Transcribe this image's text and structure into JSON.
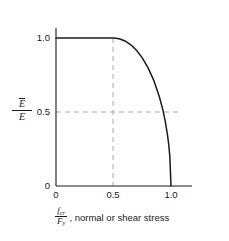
{
  "chart_data": {
    "type": "line",
    "title": "",
    "subtitle": "",
    "xlabel_numerator": "f",
    "xlabel_numerator_sub": "cr",
    "xlabel_denominator": "F",
    "xlabel_denominator_sub": "y",
    "xlabel_caption": ", normal or shear stress",
    "ylabel_numerator": "E",
    "ylabel_numerator_overbar": true,
    "ylabel_denominator": "E",
    "xlim": [
      0,
      1.15
    ],
    "ylim": [
      0,
      1.12
    ],
    "xticks": [
      0,
      0.5,
      1.0
    ],
    "xticklabels": [
      "0",
      "0.5",
      "1.0"
    ],
    "yticks": [
      0,
      0.5,
      1.0
    ],
    "yticklabels": [
      "0",
      "0.5",
      "1.0"
    ],
    "grid": false,
    "legend": null,
    "curve_color": "#1a1a1a",
    "axis_color": "#1a1a1a",
    "gridline_color": "#aaaaaa",
    "reference_lines": [
      {
        "orientation": "vertical",
        "value": 0.5,
        "style": "dashed",
        "from": 0,
        "to": 1.0
      },
      {
        "orientation": "horizontal",
        "value": 0.5,
        "style": "dashed",
        "from": 0,
        "to": 1.08
      }
    ],
    "series": [
      {
        "name": "effective modulus ratio",
        "points": [
          [
            0.0,
            1.0
          ],
          [
            0.1,
            1.0
          ],
          [
            0.2,
            1.0
          ],
          [
            0.3,
            1.0
          ],
          [
            0.4,
            1.0
          ],
          [
            0.5,
            1.0
          ],
          [
            0.55,
            0.995
          ],
          [
            0.6,
            0.98
          ],
          [
            0.65,
            0.954
          ],
          [
            0.7,
            0.917
          ],
          [
            0.75,
            0.866
          ],
          [
            0.8,
            0.8
          ],
          [
            0.85,
            0.714
          ],
          [
            0.9,
            0.6
          ],
          [
            0.93,
            0.513
          ],
          [
            0.95,
            0.436
          ],
          [
            0.97,
            0.342
          ],
          [
            0.98,
            0.282
          ],
          [
            0.99,
            0.199
          ],
          [
            1.0,
            0.0
          ]
        ],
        "description": "Flat at 1.0 up to x=0.5, then quarter-ellipse decay to 0 at x=1.0"
      }
    ]
  }
}
